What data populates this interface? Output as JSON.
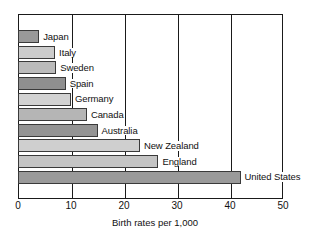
{
  "chart_data": {
    "type": "bar",
    "orientation": "horizontal",
    "title": "",
    "xlabel": "Birth rates per 1,000",
    "ylabel": "",
    "xlim": [
      0,
      50
    ],
    "xticks": [
      0,
      10,
      20,
      30,
      40,
      50
    ],
    "grid": true,
    "grid_axis": "x",
    "legend": "none",
    "categories": [
      "Japan",
      "Italy",
      "Sweden",
      "Spain",
      "Germany",
      "Canada",
      "Australia",
      "New Zealand",
      "England",
      "United States"
    ],
    "values": [
      4,
      7,
      7.2,
      9,
      10,
      13,
      15,
      23,
      26.5,
      42
    ],
    "bar_colors": [
      "#999999",
      "#cccccc",
      "#bbbbbb",
      "#8f8f8f",
      "#d2d2d2",
      "#b5b5b5",
      "#949494",
      "#cfcfcf",
      "#c4c4c4",
      "#9a9a9a"
    ],
    "bar_border_color": "#3a3a3a",
    "axis_color": "#1a1a1a",
    "background": "#ffffff"
  }
}
